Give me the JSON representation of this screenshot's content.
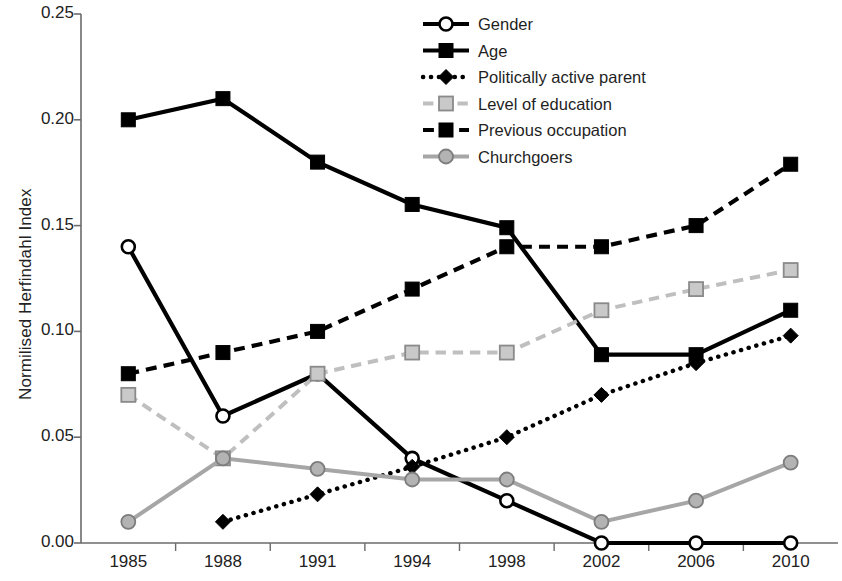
{
  "chart_data": {
    "type": "line",
    "title": "",
    "xlabel": "",
    "ylabel": "Normilised Herfindahl Index",
    "categories": [
      "1985",
      "1988",
      "1991",
      "1994",
      "1998",
      "2002",
      "2006",
      "2010"
    ],
    "ylim": [
      0.0,
      0.25
    ],
    "ytick_labels": [
      "0.00",
      "0.05",
      "0.10",
      "0.15",
      "0.20",
      "0.25"
    ],
    "ytick_values": [
      0.0,
      0.05,
      0.1,
      0.15,
      0.2,
      0.25
    ],
    "grid": false,
    "legend_position": "top-center",
    "series": [
      {
        "name": "Gender",
        "values": [
          0.14,
          0.06,
          0.08,
          0.04,
          0.02,
          0.0,
          0.0,
          0.0
        ],
        "color": "#000000",
        "line_style": "solid",
        "marker": "circle-open"
      },
      {
        "name": "Age",
        "values": [
          0.2,
          0.21,
          0.18,
          0.16,
          0.149,
          0.089,
          0.089,
          0.11
        ],
        "color": "#000000",
        "line_style": "solid",
        "marker": "square-filled"
      },
      {
        "name": "Politically active parent",
        "values": [
          null,
          0.01,
          0.023,
          0.036,
          0.05,
          0.07,
          0.085,
          0.098
        ],
        "color": "#000000",
        "line_style": "dotted",
        "marker": "diamond-filled"
      },
      {
        "name": "Level of education",
        "values": [
          0.07,
          0.04,
          0.08,
          0.09,
          0.09,
          0.11,
          0.12,
          0.129
        ],
        "color": "#BFBFBF",
        "line_style": "dashed",
        "marker": "square-gray"
      },
      {
        "name": "Previous occupation",
        "values": [
          0.08,
          0.09,
          0.1,
          0.12,
          0.14,
          0.14,
          0.15,
          0.179
        ],
        "color": "#000000",
        "line_style": "dashed",
        "marker": "square-filled"
      },
      {
        "name": "Churchgoers",
        "values": [
          0.01,
          0.04,
          0.035,
          0.03,
          0.03,
          0.01,
          0.02,
          0.038
        ],
        "color": "#A6A6A6",
        "line_style": "solid",
        "marker": "circle-gray"
      }
    ]
  },
  "legend": {
    "items": [
      {
        "label": "Gender"
      },
      {
        "label": "Age"
      },
      {
        "label": "Politically active parent"
      },
      {
        "label": "Level of education"
      },
      {
        "label": "Previous occupation"
      },
      {
        "label": "Churchgoers"
      }
    ]
  },
  "colors": {
    "axis": "#6b6b6b",
    "black": "#000000",
    "light_gray": "#BFBFBF",
    "mid_gray": "#A6A6A6",
    "text": "#222222"
  }
}
